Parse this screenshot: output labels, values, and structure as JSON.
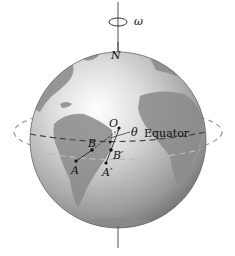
{
  "diagram": {
    "labels": {
      "omega": "ω",
      "north": "N",
      "origin": "O",
      "theta": "θ",
      "equator": "Equator",
      "A": "A",
      "B": "B",
      "A_prime": "A′",
      "B_prime": "B′"
    },
    "colors": {
      "ocean_light": "#f2f2f2",
      "ocean_dark": "#8a8a8a",
      "land": "#8c8c8c",
      "axis": "#555555",
      "dashes": "#777777"
    }
  }
}
